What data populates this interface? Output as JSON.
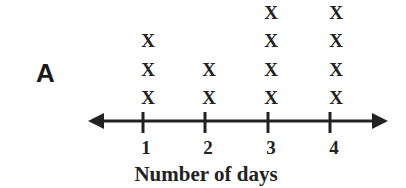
{
  "panel_label": "A",
  "chart_data": {
    "type": "dot",
    "title": "",
    "xlabel": "Number of days",
    "ylabel": "",
    "categories": [
      "1",
      "2",
      "3",
      "4"
    ],
    "values": [
      3,
      2,
      4,
      4
    ],
    "marker": "X",
    "grid": false,
    "legend": null
  }
}
